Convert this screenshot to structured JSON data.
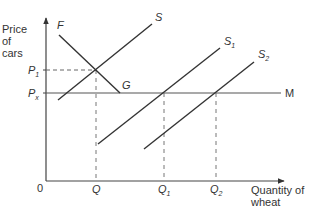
{
  "diagram": {
    "y_axis_label": [
      "Price",
      "of",
      "cars"
    ],
    "x_axis_label": [
      "Quantity of",
      "wheat"
    ],
    "origin": "0",
    "price_labels": {
      "p1": {
        "main": "P",
        "sub": "1"
      },
      "px": {
        "main": "P",
        "sub": "x"
      }
    },
    "quantity_labels": {
      "q": {
        "main": "Q",
        "sub": ""
      },
      "q1": {
        "main": "Q",
        "sub": "1"
      },
      "q2": {
        "main": "Q",
        "sub": "2"
      }
    },
    "curve_labels": {
      "f": "F",
      "g": "G",
      "s": {
        "main": "S",
        "sub": ""
      },
      "s1": {
        "main": "S",
        "sub": "1"
      },
      "s2": {
        "main": "S",
        "sub": "2"
      },
      "m": "M"
    },
    "colors": {
      "line": "#333333",
      "dashed": "#666666",
      "world_price": "#555555"
    }
  }
}
